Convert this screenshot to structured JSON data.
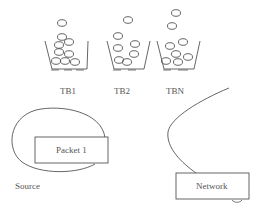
{
  "diagram": {
    "buckets": [
      {
        "label": "TB1"
      },
      {
        "label": "TB2"
      },
      {
        "label": "TBN"
      }
    ],
    "source": {
      "label": "Source",
      "packet_label": "Packet 1"
    },
    "network": {
      "label": "Network"
    },
    "colors": {
      "stroke": "#555555",
      "text": "#555555",
      "background": "#ffffff"
    }
  }
}
